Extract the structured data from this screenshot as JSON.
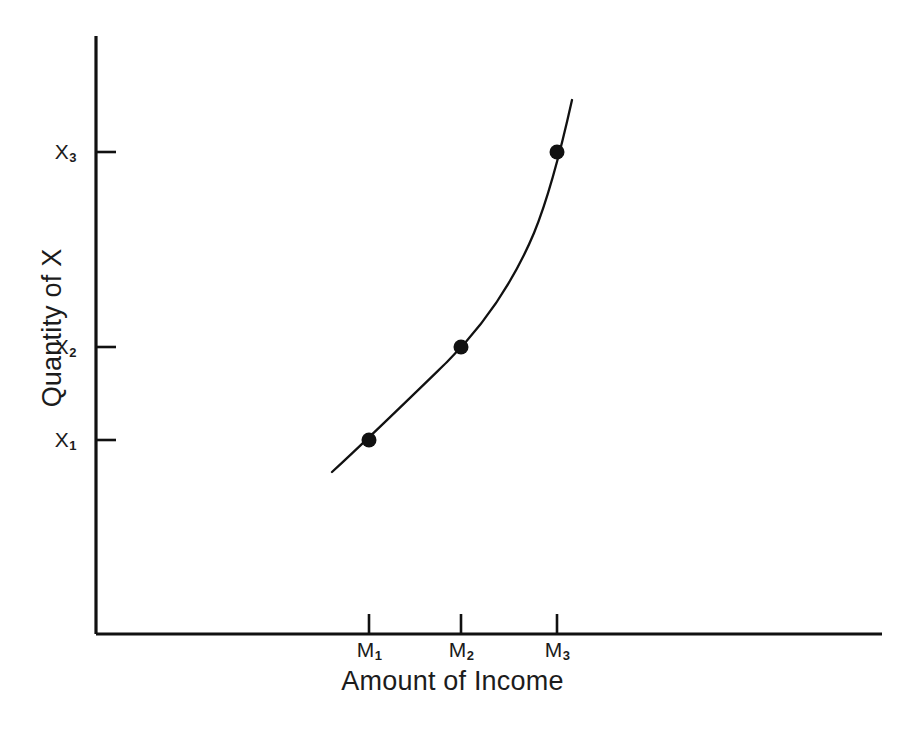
{
  "chart_data": {
    "type": "line",
    "title": "",
    "subtitle": "",
    "xlabel": "Amount of Income",
    "ylabel": "Quantity of X",
    "grid": false,
    "legend": null,
    "annotations": [],
    "x_tick_labels": [
      "M₁",
      "M₂",
      "M₃"
    ],
    "y_tick_labels": [
      "X₁",
      "X₂",
      "X₃"
    ],
    "x_tick_values": [
      1,
      2,
      3
    ],
    "y_tick_values": [
      1,
      2,
      3
    ],
    "xlim": [
      0,
      10
    ],
    "ylim": [
      0,
      10
    ],
    "series": [
      {
        "name": "Engel curve",
        "marker": "filled-circle",
        "color": "#111111",
        "points": [
          {
            "x_label": "M₁",
            "y_label": "X₁",
            "x": 369,
            "y": 440
          },
          {
            "x_label": "M₂",
            "y_label": "X₂",
            "x": 461,
            "y": 347
          },
          {
            "x_label": "M₃",
            "y_label": "X₃",
            "x": 557,
            "y": 152
          }
        ],
        "curve_path": "M 332,472 C 370,437 412,396 447,362 C 484,325 513,283 534,233 C 550,194 562,145 572,100"
      }
    ]
  },
  "axes": {
    "x_axis": {
      "label": "Amount of Income",
      "line_color": "#111111"
    },
    "y_axis": {
      "label": "Quantity of X",
      "line_color": "#111111"
    },
    "ticks": {
      "y": [
        {
          "label_main": "X",
          "label_sub": "3",
          "pixel_y": 152
        },
        {
          "label_main": "X",
          "label_sub": "2",
          "pixel_y": 347
        },
        {
          "label_main": "X",
          "label_sub": "1",
          "pixel_y": 440
        }
      ],
      "x": [
        {
          "label_main": "M",
          "label_sub": "1",
          "pixel_x": 369
        },
        {
          "label_main": "M",
          "label_sub": "2",
          "pixel_x": 461
        },
        {
          "label_main": "M",
          "label_sub": "3",
          "pixel_x": 557
        }
      ]
    }
  },
  "colors": {
    "background": "#ffffff",
    "ink": "#111111",
    "text": "#1c1c1c"
  }
}
